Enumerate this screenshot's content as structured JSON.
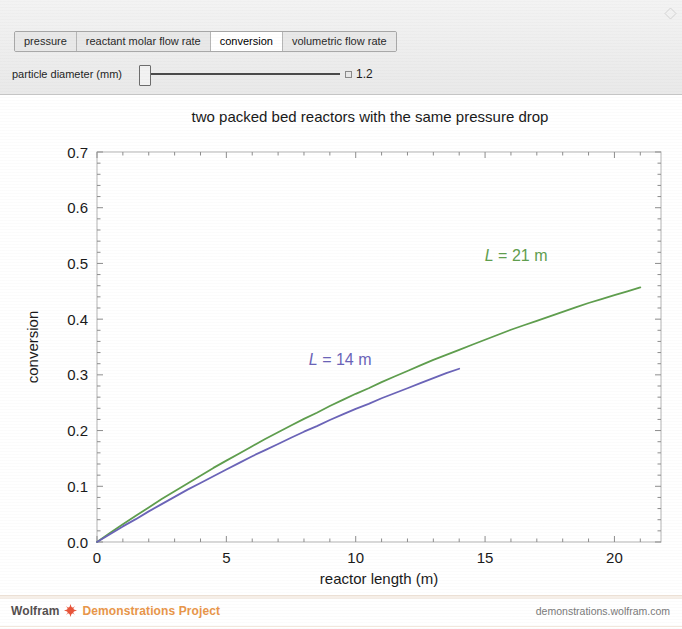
{
  "window": {
    "expand_icon": "expand-corner-icon"
  },
  "controls": {
    "tabs": [
      {
        "label": "pressure",
        "selected": false
      },
      {
        "label": "reactant molar flow rate",
        "selected": false
      },
      {
        "label": "conversion",
        "selected": true
      },
      {
        "label": "volumetric flow rate",
        "selected": false
      }
    ],
    "slider": {
      "label": "particle diameter (mm)",
      "value": "1.2",
      "fraction": 0.02
    }
  },
  "footer": {
    "wolfram": "Wolfram",
    "spikey_icon": "wolfram-spikey-icon",
    "project": "Demonstrations Project",
    "url": "demonstrations.wolfram.com",
    "wolfram_color": "#555050",
    "project_color": "#e8964a",
    "spikey_color": "#e8553a"
  },
  "chart_data": {
    "type": "line",
    "title": "two packed bed reactors with the same pressure drop",
    "xlabel": "reactor length (m)",
    "ylabel": "conversion",
    "xlim": [
      0,
      21.8
    ],
    "ylim": [
      0,
      0.7
    ],
    "xticks": [
      0,
      5,
      10,
      15,
      20
    ],
    "yticks": [
      0.0,
      0.1,
      0.2,
      0.3,
      0.4,
      0.5,
      0.6,
      0.7
    ],
    "xtick_labels": [
      "0",
      "5",
      "10",
      "15",
      "20"
    ],
    "ytick_labels": [
      "0.0",
      "0.1",
      "0.2",
      "0.3",
      "0.4",
      "0.5",
      "0.6",
      "0.7"
    ],
    "grid": false,
    "legend": "inline-annotations",
    "frame": true,
    "minor_ticks_per_interval": 5,
    "series": [
      {
        "name": "L = 21 m",
        "color": "#5f9e4e",
        "annotation": {
          "text": "L = 21 m",
          "x": 16.2,
          "y": 0.505
        },
        "x": [
          0,
          0.5,
          1,
          1.5,
          2,
          2.5,
          3,
          3.5,
          4,
          4.5,
          5,
          5.5,
          6,
          6.5,
          7,
          7.5,
          8,
          8.5,
          9,
          9.5,
          10,
          10.5,
          11,
          11.5,
          12,
          12.5,
          13,
          13.5,
          14,
          14.5,
          15,
          15.5,
          16,
          16.5,
          17,
          17.5,
          18,
          18.5,
          19,
          19.5,
          20,
          20.5,
          21
        ],
        "y": [
          0.0,
          0.016,
          0.032,
          0.047,
          0.062,
          0.077,
          0.091,
          0.105,
          0.119,
          0.133,
          0.146,
          0.159,
          0.172,
          0.185,
          0.197,
          0.209,
          0.221,
          0.232,
          0.244,
          0.255,
          0.266,
          0.276,
          0.287,
          0.297,
          0.307,
          0.317,
          0.327,
          0.336,
          0.345,
          0.354,
          0.363,
          0.372,
          0.381,
          0.389,
          0.397,
          0.405,
          0.413,
          0.421,
          0.429,
          0.436,
          0.443,
          0.45,
          0.457
        ]
      },
      {
        "name": "L = 14 m",
        "color": "#6b64b8",
        "annotation": {
          "text": "L = 14 m",
          "x": 9.4,
          "y": 0.318
        },
        "x": [
          0,
          0.5,
          1,
          1.5,
          2,
          2.5,
          3,
          3.5,
          4,
          4.5,
          5,
          5.5,
          6,
          6.5,
          7,
          7.5,
          8,
          8.5,
          9,
          9.5,
          10,
          10.5,
          11,
          11.5,
          12,
          12.5,
          13,
          13.5,
          14
        ],
        "y": [
          0.0,
          0.014,
          0.028,
          0.041,
          0.055,
          0.068,
          0.081,
          0.094,
          0.106,
          0.118,
          0.13,
          0.142,
          0.154,
          0.165,
          0.176,
          0.187,
          0.198,
          0.208,
          0.219,
          0.229,
          0.239,
          0.248,
          0.258,
          0.267,
          0.276,
          0.285,
          0.294,
          0.303,
          0.311
        ]
      }
    ]
  }
}
